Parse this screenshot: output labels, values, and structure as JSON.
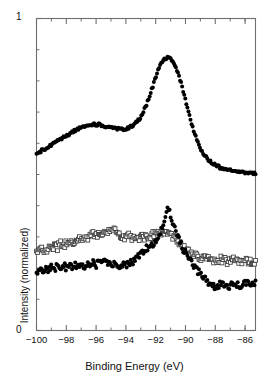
{
  "chart_data": {
    "type": "scatter",
    "title": "",
    "xlabel": "Binding Energy (eV)",
    "ylabel": "Intensity (normalized)",
    "xlim": [
      -100.0,
      -85.3
    ],
    "ylim": [
      0,
      1
    ],
    "xticks": [
      -100,
      -98,
      -96,
      -94,
      -92,
      -90,
      -88,
      -86
    ],
    "xticklabels": [
      "-100",
      "-98",
      "-96",
      "-94",
      "-92",
      "-90",
      "-88",
      "-86"
    ],
    "xminorticks": [
      -99,
      -97,
      -95,
      -93,
      -91,
      -89,
      -87,
      -86
    ],
    "yticks": [
      0,
      1
    ],
    "yticklabels": [
      "0",
      "1"
    ],
    "yminorticks": [
      0.1,
      0.2,
      0.3,
      0.4,
      0.5,
      0.6,
      0.7,
      0.8,
      0.9
    ],
    "grid": false,
    "legend": "none",
    "frame": "box",
    "tick_direction": "in",
    "axis_color": "#6f6f6f",
    "marker_color": "#000000",
    "open_marker_edge": "#3a3a3a",
    "series": [
      {
        "name": "top-spectrum",
        "marker": "filled-circle",
        "x": [
          -100.0,
          -99.8,
          -99.6,
          -99.4,
          -99.2,
          -99.0,
          -98.8,
          -98.6,
          -98.4,
          -98.2,
          -98.0,
          -97.8,
          -97.6,
          -97.4,
          -97.2,
          -97.0,
          -96.8,
          -96.6,
          -96.4,
          -96.2,
          -96.0,
          -95.8,
          -95.6,
          -95.4,
          -95.2,
          -95.0,
          -94.8,
          -94.6,
          -94.4,
          -94.2,
          -94.0,
          -93.8,
          -93.6,
          -93.4,
          -93.2,
          -93.0,
          -92.8,
          -92.6,
          -92.4,
          -92.2,
          -92.0,
          -91.8,
          -91.6,
          -91.4,
          -91.2,
          -91.0,
          -90.8,
          -90.6,
          -90.4,
          -90.2,
          -90.0,
          -89.8,
          -89.6,
          -89.4,
          -89.2,
          -89.0,
          -88.8,
          -88.6,
          -88.4,
          -88.2,
          -88.0,
          -87.6,
          -87.2,
          -86.8,
          -86.4,
          -86.0,
          -85.6,
          -85.3
        ],
        "y": [
          0.565,
          0.572,
          0.578,
          0.583,
          0.589,
          0.594,
          0.6,
          0.606,
          0.612,
          0.618,
          0.624,
          0.63,
          0.636,
          0.641,
          0.646,
          0.65,
          0.654,
          0.657,
          0.659,
          0.66,
          0.66,
          0.659,
          0.657,
          0.655,
          0.652,
          0.65,
          0.648,
          0.647,
          0.646,
          0.646,
          0.647,
          0.65,
          0.655,
          0.662,
          0.672,
          0.686,
          0.704,
          0.726,
          0.752,
          0.782,
          0.812,
          0.838,
          0.858,
          0.87,
          0.874,
          0.87,
          0.858,
          0.838,
          0.81,
          0.776,
          0.738,
          0.7,
          0.664,
          0.632,
          0.606,
          0.584,
          0.567,
          0.554,
          0.544,
          0.536,
          0.53,
          0.521,
          0.515,
          0.511,
          0.508,
          0.506,
          0.505,
          0.504
        ],
        "comment": "Upper curve: broad bump near -96 eV, sharp main peak at -91.2 eV, long tail to high energy"
      },
      {
        "name": "middle-spectrum",
        "marker": "open-square",
        "x": [
          -100.0,
          -99.8,
          -99.6,
          -99.4,
          -99.2,
          -99.0,
          -98.8,
          -98.6,
          -98.4,
          -98.2,
          -98.0,
          -97.8,
          -97.6,
          -97.4,
          -97.2,
          -97.0,
          -96.8,
          -96.6,
          -96.4,
          -96.2,
          -96.0,
          -95.8,
          -95.6,
          -95.4,
          -95.2,
          -95.0,
          -94.8,
          -94.6,
          -94.4,
          -94.2,
          -94.0,
          -93.8,
          -93.6,
          -93.4,
          -93.2,
          -93.0,
          -92.8,
          -92.6,
          -92.4,
          -92.2,
          -92.0,
          -91.8,
          -91.6,
          -91.4,
          -91.2,
          -91.0,
          -90.8,
          -90.6,
          -90.4,
          -90.2,
          -90.0,
          -89.8,
          -89.6,
          -89.4,
          -89.2,
          -89.0,
          -88.8,
          -88.6,
          -88.4,
          -88.2,
          -88.0,
          -87.6,
          -87.2,
          -86.8,
          -86.4,
          -86.0,
          -85.6,
          -85.3
        ],
        "y": [
          0.258,
          0.252,
          0.262,
          0.255,
          0.268,
          0.262,
          0.272,
          0.266,
          0.278,
          0.271,
          0.282,
          0.276,
          0.288,
          0.281,
          0.292,
          0.287,
          0.298,
          0.292,
          0.304,
          0.31,
          0.302,
          0.316,
          0.31,
          0.322,
          0.316,
          0.326,
          0.318,
          0.312,
          0.306,
          0.3,
          0.296,
          0.302,
          0.296,
          0.29,
          0.296,
          0.302,
          0.296,
          0.306,
          0.3,
          0.31,
          0.306,
          0.316,
          0.31,
          0.318,
          0.312,
          0.304,
          0.296,
          0.288,
          0.28,
          0.272,
          0.264,
          0.256,
          0.248,
          0.242,
          0.236,
          0.232,
          0.228,
          0.232,
          0.226,
          0.23,
          0.224,
          0.228,
          0.222,
          0.226,
          0.22,
          0.224,
          0.218,
          0.215
        ],
        "comment": "Middle curve: open squares, noisy, broad hump near -95 eV, weak peak near -91.4 eV"
      },
      {
        "name": "bottom-spectrum",
        "marker": "filled-circle",
        "x": [
          -100.0,
          -99.8,
          -99.6,
          -99.4,
          -99.2,
          -99.0,
          -98.8,
          -98.6,
          -98.4,
          -98.2,
          -98.0,
          -97.8,
          -97.6,
          -97.4,
          -97.2,
          -97.0,
          -96.8,
          -96.6,
          -96.4,
          -96.2,
          -96.0,
          -95.8,
          -95.6,
          -95.4,
          -95.2,
          -95.0,
          -94.8,
          -94.6,
          -94.4,
          -94.2,
          -94.0,
          -93.8,
          -93.6,
          -93.4,
          -93.2,
          -93.0,
          -92.8,
          -92.6,
          -92.4,
          -92.2,
          -92.0,
          -91.8,
          -91.6,
          -91.4,
          -91.2,
          -91.0,
          -90.8,
          -90.6,
          -90.4,
          -90.2,
          -90.0,
          -89.8,
          -89.6,
          -89.4,
          -89.2,
          -89.0,
          -88.8,
          -88.6,
          -88.4,
          -88.2,
          -88.0,
          -87.6,
          -87.2,
          -86.8,
          -86.4,
          -86.0,
          -85.6,
          -85.3
        ],
        "y": [
          0.186,
          0.2,
          0.19,
          0.204,
          0.194,
          0.206,
          0.196,
          0.208,
          0.198,
          0.21,
          0.2,
          0.212,
          0.202,
          0.214,
          0.204,
          0.216,
          0.206,
          0.218,
          0.208,
          0.22,
          0.21,
          0.22,
          0.212,
          0.222,
          0.214,
          0.218,
          0.21,
          0.214,
          0.206,
          0.212,
          0.208,
          0.22,
          0.214,
          0.228,
          0.238,
          0.248,
          0.256,
          0.268,
          0.262,
          0.276,
          0.288,
          0.302,
          0.322,
          0.35,
          0.386,
          0.372,
          0.34,
          0.312,
          0.288,
          0.266,
          0.248,
          0.232,
          0.218,
          0.204,
          0.192,
          0.18,
          0.168,
          0.158,
          0.15,
          0.146,
          0.142,
          0.148,
          0.14,
          0.15,
          0.142,
          0.152,
          0.146,
          0.154
        ],
        "comment": "Bottom curve: filled circles, noisy flat region then sharp peak at -91.2 eV, low tail"
      }
    ]
  }
}
